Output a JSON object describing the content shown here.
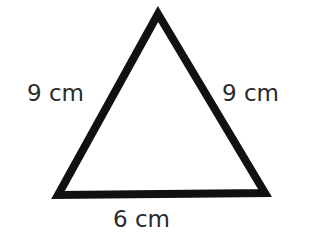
{
  "diagram": {
    "shape": "isosceles triangle",
    "stroke_color": "#111111",
    "fill_color": "#ffffff",
    "vertices": [
      [
        158,
        14
      ],
      [
        58,
        195
      ],
      [
        265,
        193
      ]
    ],
    "sides": {
      "left": {
        "label": "9 cm",
        "length": 9,
        "unit": "cm"
      },
      "right": {
        "label": "9 cm",
        "length": 9,
        "unit": "cm"
      },
      "bottom": {
        "label": "6 cm",
        "length": 6,
        "unit": "cm"
      }
    }
  }
}
